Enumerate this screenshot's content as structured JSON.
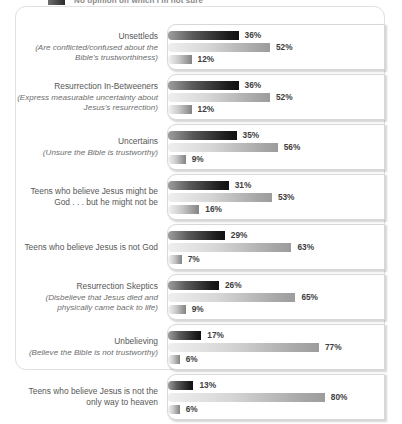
{
  "legend": {
    "series_label": "No opinion on which I'm not sure",
    "swatch_name": "legend-swatch-dark"
  },
  "chart_data": {
    "type": "bar",
    "title": "",
    "xlabel": "",
    "ylabel": "",
    "orientation": "horizontal",
    "grid": false,
    "legend_position": "top",
    "xlim": [
      0,
      100
    ],
    "value_suffix": "%",
    "series": [
      {
        "name": "series-1-dark",
        "values": [
          36,
          36,
          35,
          31,
          29,
          26,
          17,
          13
        ]
      },
      {
        "name": "series-2-mid",
        "values": [
          52,
          52,
          56,
          53,
          63,
          65,
          77,
          80
        ]
      },
      {
        "name": "series-3-light",
        "values": [
          12,
          12,
          9,
          16,
          7,
          9,
          6,
          6
        ]
      }
    ],
    "categories": [
      "Unsettleds",
      "Resurrection In-Betweeners",
      "Uncertains",
      "Teens who believe Jesus might be God . . . but he might not be",
      "Teens who believe Jesus is not God",
      "Resurrection Skeptics",
      "Unbelieving",
      "Teens who believe Jesus is not the only way to heaven"
    ]
  },
  "rows": [
    {
      "title": "Unsettleds",
      "sub": "(Are conflicted/confused about the Bible's trustworthiness)",
      "v1": "36%",
      "v2": "52%",
      "v3": "12%",
      "p1": 36,
      "p2": 52,
      "p3": 12
    },
    {
      "title": "Resurrection In-Betweeners",
      "sub": "(Express measurable uncertainty about Jesus's resurrection)",
      "v1": "36%",
      "v2": "52%",
      "v3": "12%",
      "p1": 36,
      "p2": 52,
      "p3": 12
    },
    {
      "title": "Uncertains",
      "sub": "(Unsure the Bible is trustworthy)",
      "v1": "35%",
      "v2": "56%",
      "v3": "9%",
      "p1": 35,
      "p2": 56,
      "p3": 9
    },
    {
      "title": "Teens who believe Jesus might be God . . . but he might not be",
      "sub": "",
      "v1": "31%",
      "v2": "53%",
      "v3": "16%",
      "p1": 31,
      "p2": 53,
      "p3": 16
    },
    {
      "title": "Teens who believe Jesus is not God",
      "sub": "",
      "v1": "29%",
      "v2": "63%",
      "v3": "7%",
      "p1": 29,
      "p2": 63,
      "p3": 7
    },
    {
      "title": "Resurrection Skeptics",
      "sub": "(Disbelieve that Jesus died and physically came back to life)",
      "v1": "26%",
      "v2": "65%",
      "v3": "9%",
      "p1": 26,
      "p2": 65,
      "p3": 9
    },
    {
      "title": "Unbelieving",
      "sub": "(Believe the Bible is not trustworthy)",
      "v1": "17%",
      "v2": "77%",
      "v3": "6%",
      "p1": 17,
      "p2": 77,
      "p3": 6
    },
    {
      "title": "Teens who believe Jesus is not the only way to heaven",
      "sub": "",
      "v1": "13%",
      "v2": "80%",
      "v3": "6%",
      "p1": 13,
      "p2": 80,
      "p3": 6
    }
  ]
}
